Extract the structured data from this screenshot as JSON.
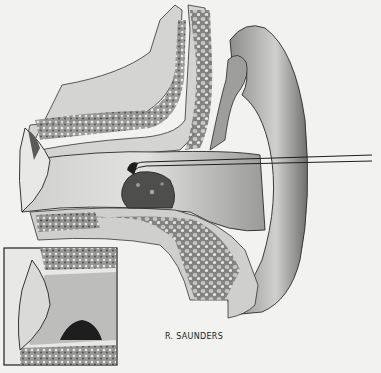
{
  "figure": {
    "signature": "R. SAUNDERS",
    "colors": {
      "background": "#f2f2f0",
      "tissue_light": "#d8d8d6",
      "tissue_mid": "#a8a8a6",
      "tissue_dark": "#5a5a58",
      "ink": "#1e1e1e"
    }
  }
}
